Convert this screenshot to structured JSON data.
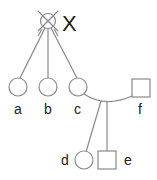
{
  "diagram": {
    "type": "pedigree",
    "proband_label": "X",
    "individuals": [
      {
        "id": "X",
        "label": "X",
        "shape": "circle",
        "crossed": true
      },
      {
        "id": "a",
        "label": "a",
        "shape": "circle"
      },
      {
        "id": "b",
        "label": "b",
        "shape": "circle"
      },
      {
        "id": "c",
        "label": "c",
        "shape": "circle"
      },
      {
        "id": "f",
        "label": "f",
        "shape": "square"
      },
      {
        "id": "d",
        "label": "d",
        "shape": "circle"
      },
      {
        "id": "e",
        "label": "e",
        "shape": "square"
      }
    ],
    "colors": {
      "line": "#8a8a8a",
      "text": "#222222"
    }
  }
}
